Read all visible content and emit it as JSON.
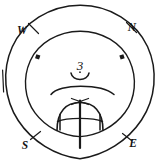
{
  "figure": {
    "background_color": "#ffffff",
    "ink_color": "#1a1a1a",
    "width": 160,
    "height": 164
  },
  "cardinals": {
    "west": {
      "label": "W",
      "x": 22,
      "y": 30,
      "angle_deg": 135
    },
    "north": {
      "label": "N",
      "x": 131,
      "y": 28,
      "angle_deg": 45
    },
    "south": {
      "label": "S",
      "x": 24,
      "y": 146,
      "angle_deg": 225
    },
    "east": {
      "label": "E",
      "x": 131,
      "y": 144,
      "angle_deg": 315
    }
  },
  "annotations": {
    "center_number": "3"
  },
  "circles": {
    "outer": {
      "cx": 80,
      "cy": 82,
      "r": 77
    },
    "inner": {
      "cx": 80,
      "cy": 84,
      "r": 53
    }
  },
  "markers": {
    "inner_dots": [
      {
        "name": "upper-left-dot",
        "x": 38,
        "y": 57
      },
      {
        "name": "upper-right-dot",
        "x": 122,
        "y": 57
      }
    ],
    "outer_ticks": [
      {
        "name": "west-tick",
        "angle_deg": 135
      },
      {
        "name": "north-tick",
        "angle_deg": 45
      },
      {
        "name": "south-tick",
        "angle_deg": 225
      },
      {
        "name": "east-tick",
        "angle_deg": 315
      },
      {
        "name": "left-tick",
        "angle_deg": 180
      }
    ]
  },
  "elements": {
    "horizon_arc": "wide shallow arc spanning the inner circle",
    "small_cup_arc": "small upward-opening arc beneath the number 3",
    "dome": "semicircular dome at lower center",
    "meridian_line": "vertical line through the dome",
    "chord_line": "horizontal chord across the dome",
    "apex_cross": "x-shaped cross at the dome apex",
    "left_foot_tick": "short tick at left end of chord",
    "right_foot_tick": "short tick at right end of chord"
  }
}
